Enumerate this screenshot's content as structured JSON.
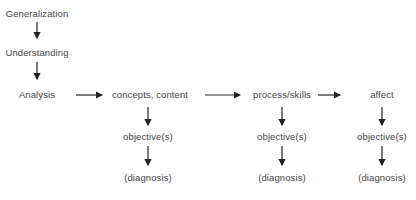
{
  "diagram": {
    "hierarchy": [
      "Generalization",
      "Understanding",
      "Analysis"
    ],
    "columns": [
      {
        "category": "concepts, content",
        "objective": "objective(s)",
        "diagnosis": "(diagnosis)"
      },
      {
        "category": "process/skills",
        "objective": "objective(s)",
        "diagnosis": "(diagnosis)"
      },
      {
        "category": "affect",
        "objective": "objective(s)",
        "diagnosis": "(diagnosis)"
      }
    ]
  }
}
